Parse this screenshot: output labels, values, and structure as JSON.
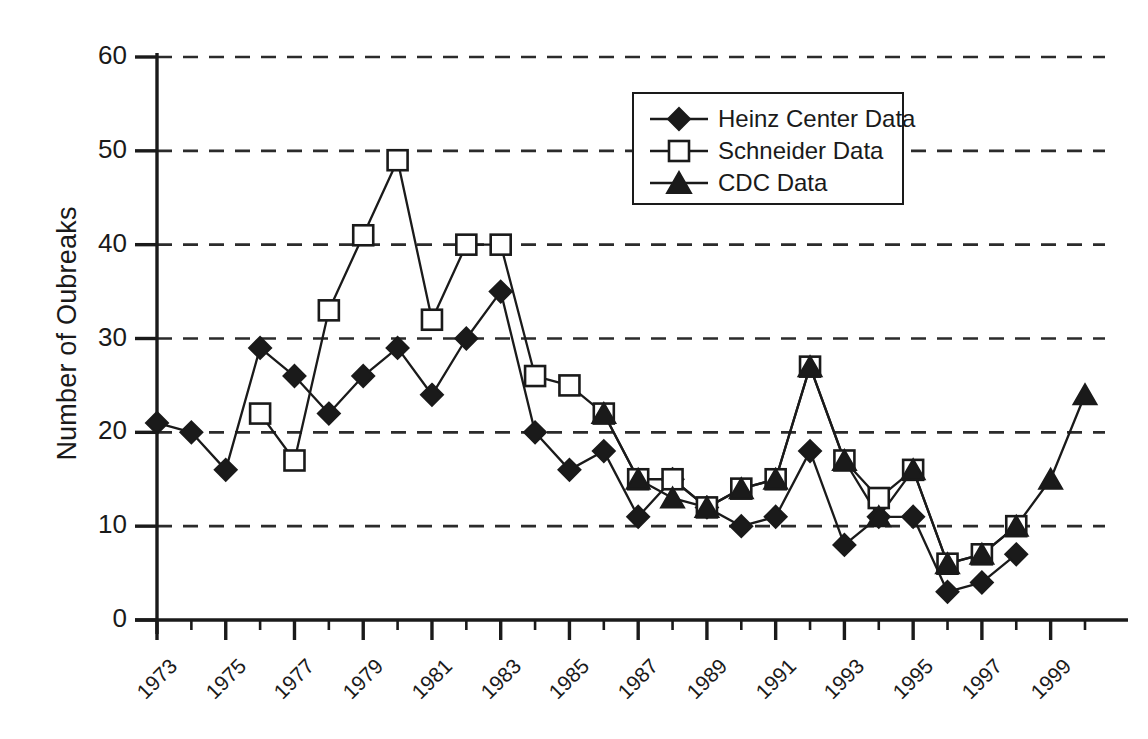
{
  "chart_data": {
    "type": "line",
    "title": "",
    "xlabel": "",
    "ylabel": "Number of Oubreaks",
    "ylim": [
      0,
      60
    ],
    "yticks": [
      0,
      10,
      20,
      30,
      40,
      50,
      60
    ],
    "xlim": [
      1973,
      2000
    ],
    "xticks": [
      1973,
      1975,
      1977,
      1979,
      1981,
      1983,
      1985,
      1987,
      1989,
      1991,
      1993,
      1995,
      1997,
      1999
    ],
    "xtick_labels": [
      "1973",
      "1975",
      "1977",
      "1979",
      "1981",
      "1983",
      "1985",
      "1987",
      "1989",
      "1991",
      "1993",
      "1995",
      "1997",
      "1999"
    ],
    "minor_xticks": [
      1974,
      1976,
      1978,
      1980,
      1982,
      1984,
      1986,
      1988,
      1990,
      1992,
      1994,
      1996,
      1998,
      2000
    ],
    "grid": "horizontal-dashed",
    "legend_position": "top-center-right",
    "series": [
      {
        "name": "Heinz Center Data",
        "marker": "filled-diamond",
        "x": [
          1973,
          1974,
          1975,
          1976,
          1977,
          1978,
          1979,
          1980,
          1981,
          1982,
          1983,
          1984,
          1985,
          1986,
          1987,
          1988,
          1989,
          1990,
          1991,
          1992,
          1993,
          1994,
          1995,
          1996,
          1997,
          1998
        ],
        "values": [
          21,
          20,
          16,
          29,
          26,
          22,
          26,
          29,
          24,
          30,
          35,
          20,
          16,
          18,
          11,
          15,
          12,
          10,
          11,
          18,
          8,
          11,
          11,
          3,
          4,
          7
        ]
      },
      {
        "name": "Schneider Data",
        "marker": "open-square",
        "x": [
          1976,
          1977,
          1978,
          1979,
          1980,
          1981,
          1982,
          1983,
          1984,
          1985,
          1986,
          1987,
          1988,
          1989,
          1990,
          1991,
          1992,
          1993,
          1994,
          1995,
          1996,
          1997,
          1998
        ],
        "values": [
          22,
          17,
          33,
          41,
          49,
          32,
          40,
          40,
          26,
          25,
          22,
          15,
          15,
          12,
          14,
          15,
          27,
          17,
          13,
          16,
          6,
          7,
          10
        ]
      },
      {
        "name": "CDC Data",
        "marker": "filled-triangle",
        "x": [
          1986,
          1987,
          1988,
          1989,
          1990,
          1991,
          1992,
          1993,
          1994,
          1995,
          1996,
          1997,
          1998,
          1999,
          2000
        ],
        "values": [
          22,
          15,
          13,
          12,
          14,
          15,
          27,
          17,
          11,
          16,
          6,
          7,
          10,
          15,
          24
        ]
      }
    ]
  },
  "legend": {
    "items": [
      {
        "label": "Heinz Center Data",
        "marker": "filled-diamond"
      },
      {
        "label": "Schneider Data",
        "marker": "open-square"
      },
      {
        "label": "CDC Data",
        "marker": "filled-triangle"
      }
    ]
  },
  "axis": {
    "y_title": "Number of Oubreaks"
  },
  "colors": {
    "ink": "#1a1a1a",
    "grid": "#2b2b2b",
    "background": "#ffffff"
  }
}
